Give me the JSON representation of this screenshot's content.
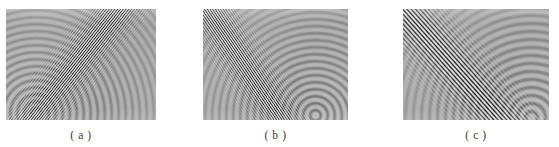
{
  "figure": {
    "background_color": "#ffffff",
    "panel_base_gray": "#a8a8a8",
    "fringe_dark_color": "#1e1e1e",
    "fringe_light_color": "#e8e8e8",
    "caption_color": "#3a3a3a",
    "panel_count": 3
  },
  "panels": [
    {
      "id": "panel-a",
      "caption": "( a )",
      "x": 6,
      "y": 9,
      "width": 150,
      "height": 111,
      "band_direction": "lower-left-to-upper-right",
      "band_angle_deg": 52,
      "fringe_spacing_px": 2.2,
      "band_center_start_x": 28,
      "band_center_end_x": 150,
      "band_half_width": 20,
      "ripple_origin_x": 30,
      "ripple_origin_y": 104,
      "ripple_spacing_px": 7,
      "description": "dense diagonal fringe band sweeping from lower-left toward upper-right with faint concentric ripples in the upper-left field"
    },
    {
      "id": "panel-b",
      "caption": "( b )",
      "x": 203,
      "y": 9,
      "width": 145,
      "height": 111,
      "band_direction": "upper-left-to-lower-right",
      "band_angle_deg": -56,
      "fringe_spacing_px": 2.2,
      "band_center_start_x": 6,
      "band_center_end_x": 110,
      "band_half_width": 19,
      "ripple_origin_x": 112,
      "ripple_origin_y": 106,
      "ripple_spacing_px": 7,
      "description": "dense diagonal fringe band sweeping from upper-left toward lower-right with concentric ripples spreading to the right field"
    },
    {
      "id": "panel-c",
      "caption": "( c )",
      "x": 403,
      "y": 9,
      "width": 146,
      "height": 111,
      "band_direction": "upper-left-to-lower-right",
      "band_angle_deg": -48,
      "fringe_spacing_px": 3.2,
      "band_center_start_x": 2,
      "band_center_end_x": 124,
      "band_half_width": 24,
      "ripple_origin_x": 128,
      "ripple_origin_y": 108,
      "ripple_spacing_px": 8,
      "description": "coarser widely spaced diagonal fringe band from upper-left to lower-right with strong concentric ripples filling the right field"
    }
  ],
  "caption_y_offset": 119
}
